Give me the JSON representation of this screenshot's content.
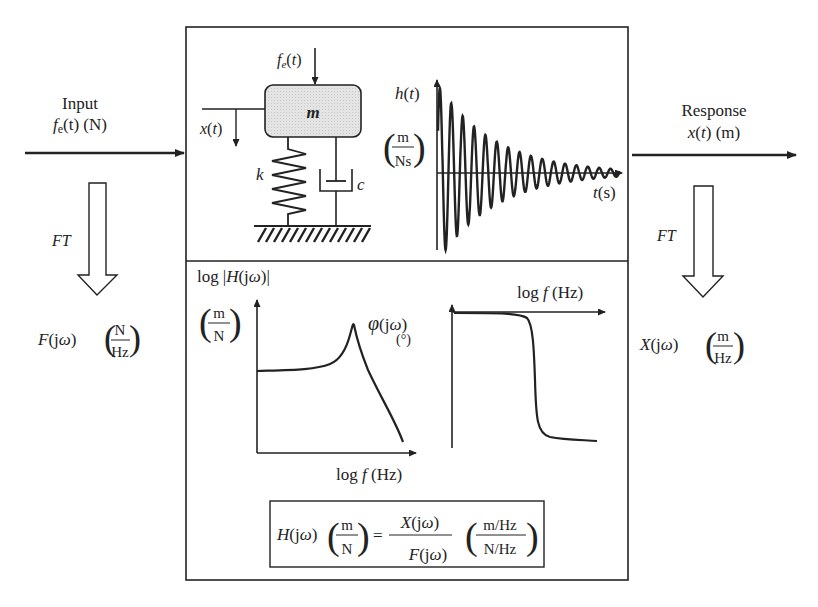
{
  "input": {
    "label": "Input",
    "signal_f": "f",
    "signal_sub": "e",
    "signal_rest": "(t) (N)",
    "ft_label": "FT",
    "freq_fn": "F(jω)",
    "unit_num": "N",
    "unit_den": "Hz"
  },
  "response": {
    "label": "Response",
    "signal": "x(t) (m)",
    "ft_label": "FT",
    "freq_fn": "X(jω)",
    "unit_num": "m",
    "unit_den": "Hz"
  },
  "system": {
    "force_label": "f",
    "force_sub": "e",
    "force_rest": "(t)",
    "mass_label": "m",
    "disp_label": "x(t)",
    "spring_label": "k",
    "damper_label": "c"
  },
  "impulse_response": {
    "y_label": "h(t)",
    "unit_num": "m",
    "unit_den": "Ns",
    "x_label": "t(s)"
  },
  "magnitude_plot": {
    "y_label_prefix": "log",
    "y_label_fn": "H(jω)",
    "unit_num": "m",
    "unit_den": "N",
    "x_label": "log f  (Hz)"
  },
  "phase_plot": {
    "y_label": "φ(jω)",
    "y_unit": "(°)",
    "x_label": "log f  (Hz)"
  },
  "formula": {
    "lhs": "H(jω)",
    "lhs_unit_num": "m",
    "lhs_unit_den": "N",
    "equals": "=",
    "rhs_num": "X(jω)",
    "rhs_den": "F(jω)",
    "rhs_unit_num": "m/Hz",
    "rhs_unit_den": "N/Hz"
  },
  "chart_data": [
    {
      "type": "line",
      "title": "Impulse response h(t)",
      "xlabel": "t(s)",
      "ylabel": "h(t) (m/Ns)",
      "description": "Exponentially decaying oscillation (damped sinusoid), ~15 visible cycles"
    },
    {
      "type": "line",
      "title": "Magnitude log|H(jω)|",
      "xlabel": "log f (Hz)",
      "ylabel": "log|H(jω)| (m/N)",
      "description": "Flat low-frequency level, resonance peak, then roll-off"
    },
    {
      "type": "line",
      "title": "Phase φ(jω)",
      "xlabel": "log f (Hz)",
      "ylabel": "φ(jω) (°)",
      "description": "Near 0° at low frequency, sharp drop at resonance to a lower constant"
    }
  ]
}
